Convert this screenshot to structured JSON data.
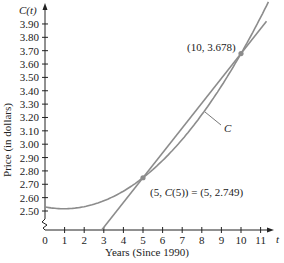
{
  "chart_data": {
    "type": "line",
    "title": "",
    "xlabel": "Years (Since 1990)",
    "ylabel": "Price (in dollars)",
    "x_axis_var": "t",
    "y_axis_var": "C(t)",
    "xlim": [
      0,
      11.6
    ],
    "ylim": [
      2.4,
      3.95
    ],
    "y_axis_break": true,
    "grid": false,
    "x_ticks": [
      0,
      1,
      2,
      3,
      4,
      5,
      6,
      7,
      8,
      9,
      10,
      11
    ],
    "y_ticks": [
      "2.50",
      "2.60",
      "2.70",
      "2.80",
      "2.90",
      "3.00",
      "3.10",
      "3.20",
      "3.30",
      "3.40",
      "3.50",
      "3.60",
      "3.70",
      "3.80",
      "3.90"
    ],
    "series": [
      {
        "name": "C",
        "kind": "curve",
        "description": "Quadratic-like price curve C(t)",
        "x": [
          0,
          1,
          2,
          3,
          4,
          5,
          6,
          7,
          8,
          9,
          10,
          11,
          11.6
        ],
        "values": [
          2.53,
          2.517,
          2.532,
          2.576,
          2.648,
          2.749,
          2.878,
          3.036,
          3.222,
          3.438,
          3.678,
          3.95,
          4.13
        ]
      },
      {
        "name": "Secant line",
        "kind": "line",
        "description": "Line through (5, 2.749) and (10, 3.678)",
        "x": [
          3.0,
          11.3
        ],
        "values": [
          2.377,
          3.919
        ]
      }
    ],
    "points": [
      {
        "x": 5,
        "y": 2.749,
        "label": "(5, C(5)) = (5, 2.749)"
      },
      {
        "x": 10,
        "y": 3.678,
        "label": "(10, 3.678)"
      }
    ],
    "annotations": [
      {
        "text": "C",
        "target": "curve"
      }
    ]
  },
  "labels": {
    "y_var": "C(t)",
    "x_var": "t",
    "x_title": "Years (Since 1990)",
    "y_title": "Price (in dollars)",
    "point1": "(5, C(5)) = (5, 2.749)",
    "point2": "(10, 3.678)",
    "curve_name": "C"
  },
  "colors": {
    "curve": "#8c8c8c",
    "line": "#8c8c8c",
    "axis": "#222222",
    "point": "#8c8c8c"
  }
}
